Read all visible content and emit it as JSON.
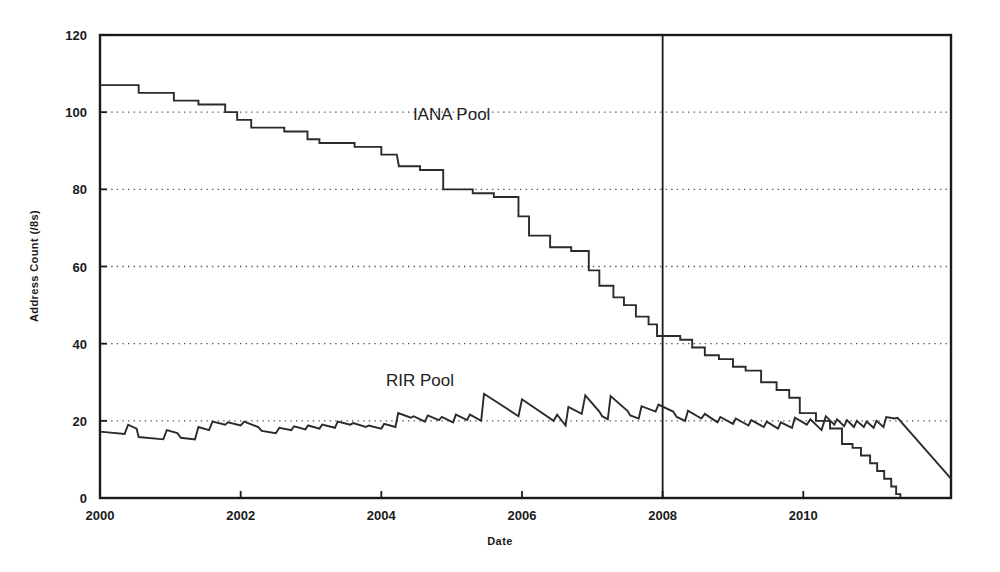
{
  "chart_data": {
    "type": "line",
    "title": "",
    "xlabel": "Date",
    "ylabel": "Address Count (/8s)",
    "xlim": [
      2000.0,
      2012.1
    ],
    "ylim": [
      0,
      120
    ],
    "xticks": [
      2000,
      2002,
      2004,
      2006,
      2008,
      2010
    ],
    "xticklabels": [
      "2000",
      "2002",
      "2004",
      "2006",
      "2008",
      "2010"
    ],
    "yticks": [
      0,
      20,
      40,
      60,
      80,
      100,
      120
    ],
    "yticklabels": [
      "0",
      "20",
      "40",
      "60",
      "80",
      "100",
      "120"
    ],
    "grid": "horizontal-dotted",
    "gridlines_at": [
      20,
      40,
      60,
      80,
      100
    ],
    "legend": "inline-annotations",
    "annotations": [
      {
        "text": "IANA Pool",
        "x": 2005.0,
        "y": 98
      },
      {
        "text": "RIR Pool",
        "x": 2004.55,
        "y": 29
      }
    ],
    "reference_lines": [
      {
        "orientation": "vertical",
        "x": 2008,
        "label": "2008"
      }
    ],
    "series": [
      {
        "name": "IANA Pool",
        "style": "step",
        "points": [
          [
            2000.0,
            107
          ],
          [
            2000.55,
            107
          ],
          [
            2000.55,
            105
          ],
          [
            2001.05,
            105
          ],
          [
            2001.05,
            103
          ],
          [
            2001.4,
            103
          ],
          [
            2001.4,
            102
          ],
          [
            2001.78,
            102
          ],
          [
            2001.78,
            100
          ],
          [
            2001.95,
            100
          ],
          [
            2001.95,
            98
          ],
          [
            2002.15,
            98
          ],
          [
            2002.15,
            96
          ],
          [
            2002.62,
            96
          ],
          [
            2002.62,
            95
          ],
          [
            2002.95,
            95
          ],
          [
            2002.95,
            93
          ],
          [
            2003.12,
            93
          ],
          [
            2003.12,
            92
          ],
          [
            2003.62,
            92
          ],
          [
            2003.62,
            91
          ],
          [
            2004.0,
            91
          ],
          [
            2004.0,
            89
          ],
          [
            2004.22,
            89
          ],
          [
            2004.25,
            86
          ],
          [
            2004.55,
            86
          ],
          [
            2004.55,
            85
          ],
          [
            2004.88,
            85
          ],
          [
            2004.88,
            80
          ],
          [
            2005.3,
            80
          ],
          [
            2005.3,
            79
          ],
          [
            2005.6,
            79
          ],
          [
            2005.6,
            78
          ],
          [
            2005.95,
            78
          ],
          [
            2005.95,
            73
          ],
          [
            2006.1,
            73
          ],
          [
            2006.1,
            68
          ],
          [
            2006.4,
            68
          ],
          [
            2006.4,
            65
          ],
          [
            2006.7,
            65
          ],
          [
            2006.7,
            64
          ],
          [
            2006.95,
            64
          ],
          [
            2006.95,
            59
          ],
          [
            2007.1,
            59
          ],
          [
            2007.1,
            55
          ],
          [
            2007.3,
            55
          ],
          [
            2007.3,
            52
          ],
          [
            2007.45,
            52
          ],
          [
            2007.45,
            50
          ],
          [
            2007.62,
            50
          ],
          [
            2007.62,
            47
          ],
          [
            2007.8,
            47
          ],
          [
            2007.8,
            45
          ],
          [
            2007.92,
            45
          ],
          [
            2007.92,
            42
          ],
          [
            2008.25,
            42
          ],
          [
            2008.25,
            41
          ],
          [
            2008.42,
            41
          ],
          [
            2008.42,
            39
          ],
          [
            2008.6,
            39
          ],
          [
            2008.6,
            37
          ],
          [
            2008.8,
            37
          ],
          [
            2008.8,
            36
          ],
          [
            2009.0,
            36
          ],
          [
            2009.0,
            34
          ],
          [
            2009.18,
            34
          ],
          [
            2009.18,
            33
          ],
          [
            2009.4,
            33
          ],
          [
            2009.4,
            30
          ],
          [
            2009.62,
            30
          ],
          [
            2009.62,
            28
          ],
          [
            2009.8,
            28
          ],
          [
            2009.8,
            26
          ],
          [
            2009.95,
            26
          ],
          [
            2009.95,
            22
          ],
          [
            2010.18,
            22
          ],
          [
            2010.18,
            20
          ],
          [
            2010.38,
            20
          ],
          [
            2010.38,
            18
          ],
          [
            2010.55,
            18
          ],
          [
            2010.55,
            14
          ],
          [
            2010.7,
            14
          ],
          [
            2010.7,
            13
          ],
          [
            2010.82,
            13
          ],
          [
            2010.82,
            11
          ],
          [
            2010.95,
            11
          ],
          [
            2010.95,
            9
          ],
          [
            2011.05,
            9
          ],
          [
            2011.05,
            7
          ],
          [
            2011.15,
            7
          ],
          [
            2011.15,
            5
          ],
          [
            2011.25,
            5
          ],
          [
            2011.25,
            3
          ],
          [
            2011.32,
            3
          ],
          [
            2011.32,
            1
          ],
          [
            2011.38,
            1
          ],
          [
            2011.38,
            0
          ]
        ]
      },
      {
        "name": "RIR Pool",
        "style": "sawtooth",
        "points": [
          [
            2000.0,
            17.2
          ],
          [
            2000.35,
            16.6
          ],
          [
            2000.4,
            19.0
          ],
          [
            2000.52,
            18.0
          ],
          [
            2000.55,
            15.8
          ],
          [
            2000.9,
            15.2
          ],
          [
            2000.95,
            17.6
          ],
          [
            2001.1,
            16.8
          ],
          [
            2001.15,
            15.6
          ],
          [
            2001.35,
            15.2
          ],
          [
            2001.4,
            18.4
          ],
          [
            2001.55,
            17.6
          ],
          [
            2001.6,
            19.8
          ],
          [
            2001.78,
            19.0
          ],
          [
            2001.82,
            19.6
          ],
          [
            2002.0,
            18.8
          ],
          [
            2002.05,
            19.8
          ],
          [
            2002.25,
            18.4
          ],
          [
            2002.3,
            17.4
          ],
          [
            2002.5,
            16.8
          ],
          [
            2002.55,
            18.2
          ],
          [
            2002.72,
            17.6
          ],
          [
            2002.76,
            18.6
          ],
          [
            2002.92,
            17.8
          ],
          [
            2002.96,
            18.8
          ],
          [
            2003.12,
            18.0
          ],
          [
            2003.16,
            19.0
          ],
          [
            2003.34,
            18.2
          ],
          [
            2003.38,
            19.8
          ],
          [
            2003.56,
            19.0
          ],
          [
            2003.6,
            19.4
          ],
          [
            2003.78,
            18.4
          ],
          [
            2003.82,
            18.8
          ],
          [
            2004.0,
            18.0
          ],
          [
            2004.04,
            19.2
          ],
          [
            2004.2,
            18.4
          ],
          [
            2004.24,
            22.0
          ],
          [
            2004.42,
            20.8
          ],
          [
            2004.46,
            21.2
          ],
          [
            2004.62,
            19.8
          ],
          [
            2004.66,
            21.4
          ],
          [
            2004.82,
            20.2
          ],
          [
            2004.86,
            21.0
          ],
          [
            2005.02,
            19.6
          ],
          [
            2005.06,
            21.6
          ],
          [
            2005.22,
            20.2
          ],
          [
            2005.26,
            21.6
          ],
          [
            2005.42,
            20.0
          ],
          [
            2005.46,
            27.0
          ],
          [
            2005.95,
            21.2
          ],
          [
            2006.0,
            25.6
          ],
          [
            2006.45,
            20.0
          ],
          [
            2006.5,
            21.6
          ],
          [
            2006.62,
            18.8
          ],
          [
            2006.66,
            23.6
          ],
          [
            2006.85,
            21.8
          ],
          [
            2006.9,
            26.6
          ],
          [
            2007.1,
            22.4
          ],
          [
            2007.14,
            21.2
          ],
          [
            2007.22,
            20.4
          ],
          [
            2007.26,
            26.4
          ],
          [
            2007.5,
            22.6
          ],
          [
            2007.54,
            21.4
          ],
          [
            2007.66,
            20.6
          ],
          [
            2007.7,
            23.8
          ],
          [
            2007.9,
            22.4
          ],
          [
            2007.94,
            24.2
          ],
          [
            2008.15,
            22.4
          ],
          [
            2008.2,
            21.0
          ],
          [
            2008.32,
            20.0
          ],
          [
            2008.36,
            22.6
          ],
          [
            2008.55,
            20.6
          ],
          [
            2008.6,
            21.8
          ],
          [
            2008.78,
            19.6
          ],
          [
            2008.82,
            21.0
          ],
          [
            2009.0,
            19.2
          ],
          [
            2009.04,
            20.6
          ],
          [
            2009.22,
            18.8
          ],
          [
            2009.26,
            20.2
          ],
          [
            2009.44,
            18.4
          ],
          [
            2009.48,
            19.8
          ],
          [
            2009.64,
            18.0
          ],
          [
            2009.68,
            19.6
          ],
          [
            2009.84,
            18.2
          ],
          [
            2009.88,
            20.8
          ],
          [
            2010.05,
            19.0
          ],
          [
            2010.1,
            20.4
          ],
          [
            2010.26,
            17.6
          ],
          [
            2010.32,
            21.2
          ],
          [
            2010.44,
            19.0
          ],
          [
            2010.48,
            20.4
          ],
          [
            2010.58,
            18.6
          ],
          [
            2010.62,
            20.2
          ],
          [
            2010.72,
            18.4
          ],
          [
            2010.76,
            20.0
          ],
          [
            2010.86,
            18.4
          ],
          [
            2010.9,
            19.8
          ],
          [
            2011.0,
            18.2
          ],
          [
            2011.04,
            20.0
          ],
          [
            2011.14,
            18.4
          ],
          [
            2011.18,
            21.0
          ],
          [
            2011.3,
            20.6
          ],
          [
            2011.34,
            20.8
          ],
          [
            2012.1,
            5.0
          ]
        ]
      }
    ]
  },
  "colors": {
    "background": "#ffffff",
    "axis": "#1a1a1a",
    "grid": "#555555",
    "series_line": "#2b2b2b",
    "reference_line": "#1a1a1a"
  }
}
